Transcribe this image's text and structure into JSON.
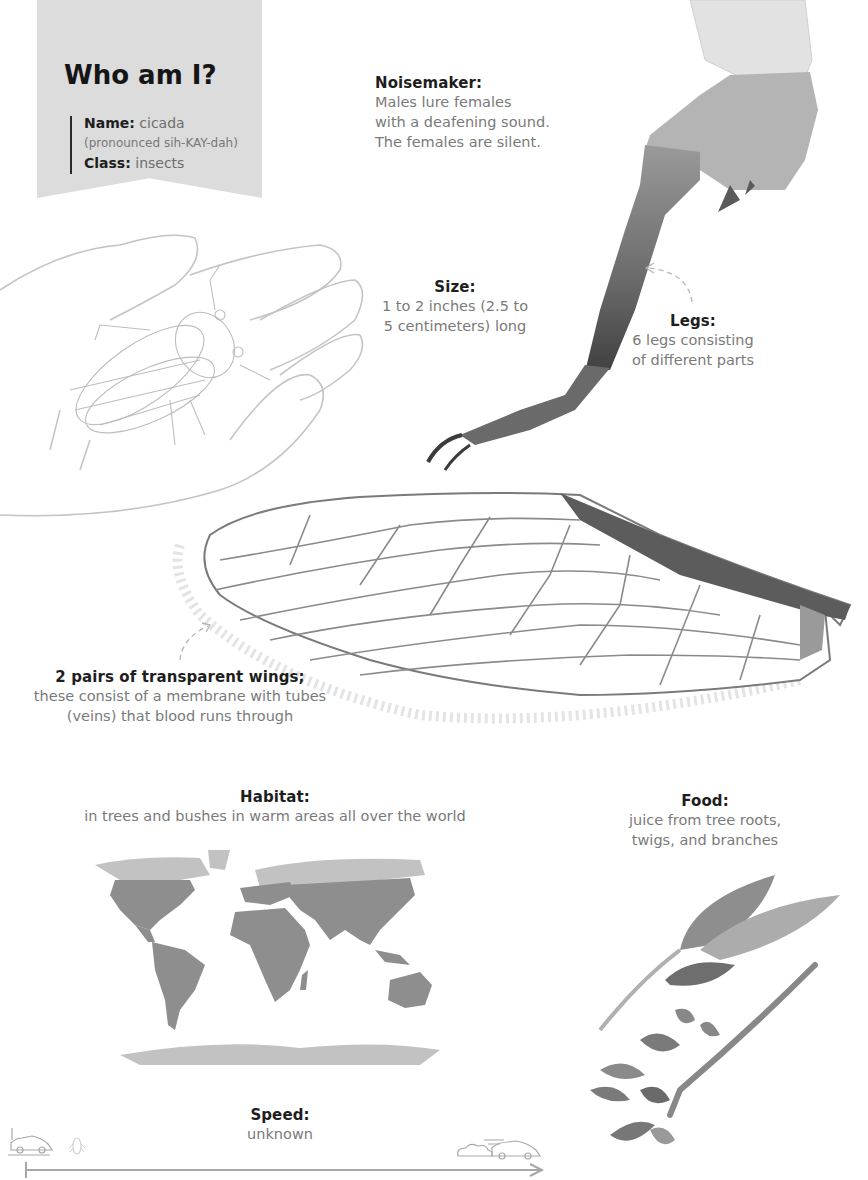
{
  "title_card": {
    "heading": "Who am I?",
    "name_label": "Name:",
    "name_value": "cicada",
    "pronunciation": "(pronounced sih-KAY-dah)",
    "class_label": "Class:",
    "class_value": "insects",
    "background_color": "#dcdcdc"
  },
  "facts": {
    "noisemaker": {
      "label": "Noisemaker:",
      "lines": [
        "Males lure females",
        "with a deafening sound.",
        "The females are silent."
      ]
    },
    "size": {
      "label": "Size:",
      "lines": [
        "1 to 2 inches (2.5 to",
        "5 centimeters) long"
      ]
    },
    "legs": {
      "label": "Legs:",
      "lines": [
        "6 legs consisting",
        "of different parts"
      ]
    },
    "wings": {
      "label": "2 pairs of transparent wings;",
      "lines": [
        "these consist of a membrane with tubes",
        "(veins) that blood runs through"
      ]
    },
    "habitat": {
      "label": "Habitat:",
      "lines": [
        "in trees and bushes in warm areas all over the world"
      ]
    },
    "food": {
      "label": "Food:",
      "lines": [
        "juice from tree roots,",
        "twigs, and branches"
      ]
    },
    "speed": {
      "label": "Speed:",
      "lines": [
        "unknown"
      ]
    }
  },
  "illustrations": {
    "hand": "hand-holding-cicada-sketch",
    "leg": "cicada-leg-watercolor",
    "wing": "cicada-wing-watercolor",
    "map": "world-map-habitat",
    "leaves": "twig-with-leaves",
    "speed_slow": "slow-car-icon",
    "speed_insect": "cicada-icon",
    "speed_fast": "fast-car-icon"
  },
  "colors": {
    "label_text": "#1e1e1e",
    "body_text": "#7a7a7a",
    "map_habitat": "#8e8e8e",
    "map_other": "#c2c2c2",
    "sketch_line": "#bdbdbd"
  }
}
